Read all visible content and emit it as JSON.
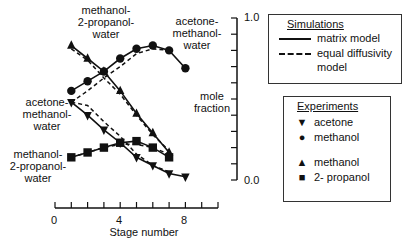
{
  "chart_data": {
    "type": "line",
    "title": "",
    "xlabel": "Stage number",
    "ylabel": "mole fraction",
    "xlim": [
      0,
      10
    ],
    "ylim": [
      0.0,
      1.0
    ],
    "x_ticks": [
      "0",
      "4",
      "8"
    ],
    "y_ticks": [
      "1.0",
      "0.0"
    ],
    "systems": [
      {
        "name": "acetone-methanol-water",
        "series": [
          {
            "name": "acetone (experiment)",
            "marker": "inverted-triangle",
            "x": [
              1,
              2,
              3,
              4,
              5,
              6,
              7,
              8
            ],
            "y": [
              0.48,
              0.4,
              0.31,
              0.23,
              0.14,
              0.09,
              0.04,
              0.02
            ]
          },
          {
            "name": "methanol (experiment)",
            "marker": "circle",
            "x": [
              1,
              2,
              3,
              4,
              5,
              6,
              7,
              8
            ],
            "y": [
              0.55,
              0.61,
              0.67,
              0.75,
              0.81,
              0.83,
              0.8,
              0.69
            ]
          }
        ]
      },
      {
        "name": "methanol-2-propanol-water",
        "series": [
          {
            "name": "methanol (experiment)",
            "marker": "triangle",
            "x": [
              1,
              2,
              3,
              4,
              5,
              6,
              7
            ],
            "y": [
              0.83,
              0.75,
              0.67,
              0.55,
              0.41,
              0.29,
              0.17
            ]
          },
          {
            "name": "2-propanol (experiment)",
            "marker": "square",
            "x": [
              1,
              2,
              3,
              4,
              5,
              6,
              7
            ],
            "y": [
              0.14,
              0.17,
              0.2,
              0.23,
              0.24,
              0.2,
              0.14
            ]
          }
        ]
      }
    ],
    "legend": {
      "simulations": [
        "matrix model",
        "equal diffusivity model"
      ],
      "experiments": [
        "acetone",
        "methanol",
        "methanol",
        "2- propanol"
      ]
    },
    "grid": false
  },
  "labels": {
    "mpw_top": [
      "methanol-",
      "2-propanol-",
      "water"
    ],
    "amw_top": [
      "acetone-",
      "methanol-",
      "water"
    ],
    "amw_left": [
      "acetone-",
      "methanol-",
      "water"
    ],
    "mpw_left": [
      "methanol-",
      "2-propanol-",
      "water"
    ],
    "ylabel": [
      "mole",
      "fraction"
    ],
    "xlabel": "Stage number",
    "x0": "0",
    "x4": "4",
    "x8": "8",
    "y1": "1.0",
    "y0": "0.0"
  },
  "legend": {
    "sim_title": "Simulations",
    "sim_solid": "matrix model",
    "sim_dashed_1": "equal diffusivity",
    "sim_dashed_2": "model",
    "exp_title": "Experiments",
    "exp_items": [
      {
        "symbol": "▼",
        "label": "acetone"
      },
      {
        "symbol": "●",
        "label": "methanol"
      },
      {
        "symbol": "▲",
        "label": "methanol"
      },
      {
        "symbol": "■",
        "label": "2- propanol"
      }
    ]
  }
}
